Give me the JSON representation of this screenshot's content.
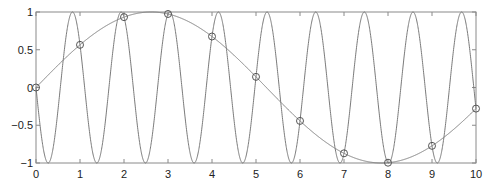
{
  "chart_data": {
    "type": "line",
    "title": "",
    "xlabel": "",
    "ylabel": "",
    "xlim": [
      0,
      10
    ],
    "ylim": [
      -1,
      1
    ],
    "grid": false,
    "legend": null,
    "x_ticks": [
      "0",
      "1",
      "2",
      "3",
      "4",
      "5",
      "6",
      "7",
      "8",
      "9",
      "10"
    ],
    "y_ticks": [
      "-1",
      "-0.5",
      "0",
      "0.5",
      "1"
    ],
    "series": [
      {
        "name": "slow sine",
        "formula": "sin(0.6x)",
        "style": "line",
        "color": "#808080"
      },
      {
        "name": "fast sine (alias)",
        "formula": "-sin((2*pi-0.6)x)",
        "style": "line",
        "color": "#808080"
      },
      {
        "name": "samples",
        "style": "circle-markers",
        "color": "#808080",
        "x": [
          0,
          1,
          2,
          3,
          4,
          5,
          6,
          7,
          8,
          9,
          10
        ],
        "y": [
          0,
          0.56,
          0.93,
          0.97,
          0.68,
          0.14,
          -0.44,
          -0.87,
          -0.99,
          -0.77,
          -0.28
        ]
      }
    ]
  },
  "axes": {
    "x_labels": [
      "0",
      "1",
      "2",
      "3",
      "4",
      "5",
      "6",
      "7",
      "8",
      "9",
      "10"
    ],
    "y_labels": [
      "1",
      "0.5",
      "0",
      "−0.5",
      "−1"
    ]
  }
}
